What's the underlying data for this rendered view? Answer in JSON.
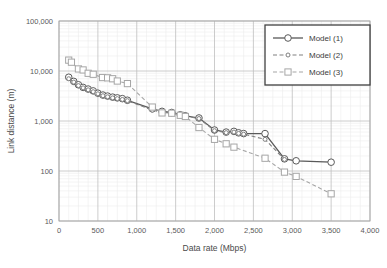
{
  "chart_data": {
    "type": "line",
    "title": "",
    "xlabel": "Data rate (Mbps)",
    "ylabel": "Link distance (m)",
    "xlim": [
      0,
      4000
    ],
    "ylim": [
      10,
      100000
    ],
    "yscale": "log",
    "xscale": "linear",
    "grid": true,
    "minor_grid": true,
    "legend_position": "top-right",
    "xticks": [
      0,
      500,
      1000,
      1500,
      2000,
      2500,
      3000,
      3500,
      4000
    ],
    "xtick_labels": [
      "0",
      "500",
      "1,000",
      "1,500",
      "2,000",
      "2,500",
      "3,000",
      "3,500",
      "4,000"
    ],
    "yticks": [
      10,
      100,
      1000,
      10000,
      100000
    ],
    "ytick_labels": [
      "10",
      "100",
      "1,000",
      "10,000",
      "100,000"
    ],
    "series": [
      {
        "name": "Model (1)",
        "style": "solid",
        "marker": "circle",
        "color": "#595959",
        "points": [
          [
            125,
            7500
          ],
          [
            190,
            6200
          ],
          [
            250,
            5300
          ],
          [
            310,
            4700
          ],
          [
            375,
            4350
          ],
          [
            440,
            4000
          ],
          [
            500,
            3600
          ],
          [
            565,
            3300
          ],
          [
            625,
            3150
          ],
          [
            690,
            3000
          ],
          [
            750,
            2900
          ],
          [
            815,
            2800
          ],
          [
            880,
            2600
          ],
          [
            1200,
            1750
          ],
          [
            1325,
            1560
          ],
          [
            1450,
            1480
          ],
          [
            1560,
            1330
          ],
          [
            1625,
            1270
          ],
          [
            1800,
            1150
          ],
          [
            2000,
            660
          ],
          [
            2150,
            600
          ],
          [
            2250,
            620
          ],
          [
            2310,
            580
          ],
          [
            2375,
            560
          ],
          [
            2650,
            560
          ],
          [
            2900,
            175
          ],
          [
            3050,
            160
          ],
          [
            3500,
            150
          ]
        ]
      },
      {
        "name": "Model (2)",
        "style": "dashed",
        "marker": "small-circle",
        "color": "#808080",
        "points": [
          [
            125,
            7000
          ],
          [
            190,
            6000
          ],
          [
            250,
            5100
          ],
          [
            310,
            4600
          ],
          [
            375,
            4200
          ],
          [
            440,
            3850
          ],
          [
            500,
            3500
          ],
          [
            565,
            3200
          ],
          [
            625,
            3050
          ],
          [
            690,
            2900
          ],
          [
            750,
            2800
          ],
          [
            815,
            2700
          ],
          [
            880,
            2550
          ],
          [
            1200,
            1650
          ],
          [
            1325,
            1500
          ],
          [
            1450,
            1430
          ],
          [
            1560,
            1300
          ],
          [
            1625,
            1240
          ],
          [
            1800,
            1120
          ],
          [
            2000,
            640
          ],
          [
            2150,
            585
          ],
          [
            2250,
            600
          ],
          [
            2310,
            565
          ],
          [
            2375,
            545
          ],
          [
            2650,
            430
          ],
          [
            2900,
            170
          ]
        ]
      },
      {
        "name": "Model (3)",
        "style": "dashed",
        "marker": "square",
        "color": "#a6a6a6",
        "points": [
          [
            125,
            16500
          ],
          [
            160,
            15000
          ],
          [
            250,
            11000
          ],
          [
            310,
            10500
          ],
          [
            375,
            9000
          ],
          [
            440,
            8600
          ],
          [
            560,
            7400
          ],
          [
            625,
            7300
          ],
          [
            690,
            7000
          ],
          [
            750,
            6300
          ],
          [
            880,
            5600
          ],
          [
            1200,
            1900
          ],
          [
            1325,
            1450
          ],
          [
            1450,
            1430
          ],
          [
            1560,
            1300
          ],
          [
            1625,
            1230
          ],
          [
            1800,
            740
          ],
          [
            2000,
            430
          ],
          [
            2150,
            350
          ],
          [
            2250,
            300
          ],
          [
            2650,
            180
          ],
          [
            2900,
            95
          ],
          [
            3050,
            78
          ],
          [
            3500,
            35
          ]
        ]
      }
    ]
  },
  "legend": {
    "items": [
      {
        "label": "Model (1)"
      },
      {
        "label": "Model (2)"
      },
      {
        "label": "Model (3)"
      }
    ]
  },
  "colors": {
    "series1": "#595959",
    "series2": "#808080",
    "series3": "#a6a6a6",
    "major_grid": "#bfbfbf",
    "minor_grid": "#ededed",
    "axis": "#a6a6a6",
    "legend_border": "#404040",
    "plot_background": "#ffffff"
  }
}
